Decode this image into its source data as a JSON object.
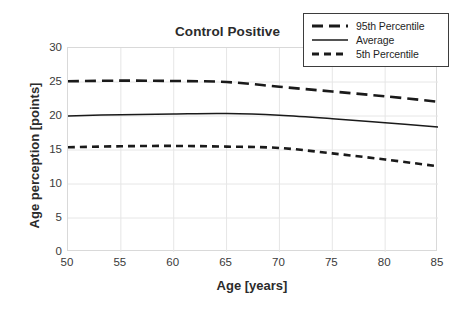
{
  "chart_data": {
    "type": "line",
    "title": "Control Positive",
    "xlabel": "Age [years]",
    "ylabel": "Age perception [points]",
    "xlim": [
      50,
      85
    ],
    "ylim": [
      0,
      30
    ],
    "xticks": [
      50,
      55,
      60,
      65,
      70,
      75,
      80,
      85
    ],
    "yticks": [
      0,
      5,
      10,
      15,
      20,
      25,
      30
    ],
    "grid": true,
    "legend_position": "top-right",
    "x": [
      50,
      55,
      60,
      65,
      70,
      75,
      80,
      85
    ],
    "series": [
      {
        "name": "95th Percentile",
        "style": "dashed",
        "color": "#1a1a1a",
        "values": [
          25.1,
          25.2,
          25.15,
          25.0,
          24.3,
          23.6,
          22.9,
          22.1
        ]
      },
      {
        "name": "Average",
        "style": "solid",
        "color": "#1a1a1a",
        "values": [
          20.0,
          20.2,
          20.3,
          20.35,
          20.1,
          19.6,
          19.0,
          18.4
        ]
      },
      {
        "name": "5th Percentile",
        "style": "dashed",
        "color": "#1a1a1a",
        "values": [
          15.4,
          15.55,
          15.6,
          15.5,
          15.3,
          14.5,
          13.6,
          12.6
        ]
      }
    ]
  },
  "legend": {
    "items": [
      {
        "label": "95th Percentile",
        "swatch": "long-dash-line-icon"
      },
      {
        "label": "Average",
        "swatch": "solid-line-icon"
      },
      {
        "label": "5th Percentile",
        "swatch": "short-dash-line-icon"
      }
    ]
  },
  "axes": {
    "y_tick_labels": [
      "30",
      "25",
      "20",
      "15",
      "10",
      "5",
      "0"
    ],
    "x_tick_labels": [
      "50",
      "55",
      "60",
      "65",
      "70",
      "75",
      "80",
      "85"
    ]
  }
}
